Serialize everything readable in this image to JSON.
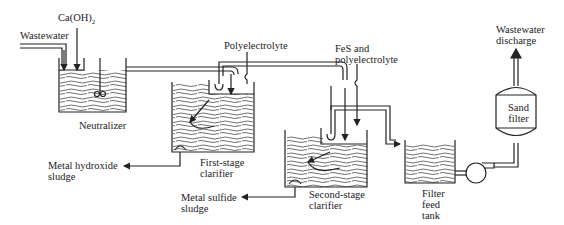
{
  "diagram": {
    "type": "process-flow",
    "inputs": {
      "wastewater": "Wastewater",
      "lime": "Ca(OH)",
      "lime_subscript": "2",
      "polyelectrolyte": "Polyelectrolyte",
      "fes_line1": "FeS and",
      "fes_line2": "polyelectrolyte"
    },
    "units": {
      "neutralizer": "Neutralizer",
      "first_clarifier_line1": "First-stage",
      "first_clarifier_line2": "clarifier",
      "second_clarifier_line1": "Second-stage",
      "second_clarifier_line2": "clarifier",
      "filter_feed_line1": "Filter",
      "filter_feed_line2": "feed",
      "filter_feed_line3": "tank",
      "sand_filter_line1": "Sand",
      "sand_filter_line2": "filter"
    },
    "outputs": {
      "hydroxide_sludge_line1": "Metal hydroxide",
      "hydroxide_sludge_line2": "sludge",
      "sulfide_sludge_line1": "Metal sulfide",
      "sulfide_sludge_line2": "sludge",
      "discharge_line1": "Wastewater",
      "discharge_line2": "discharge"
    },
    "flow_sequence": [
      "Wastewater",
      "Neutralizer",
      "First-stage clarifier",
      "Second-stage clarifier",
      "Filter feed tank",
      "Pump",
      "Sand filter",
      "Wastewater discharge"
    ]
  }
}
